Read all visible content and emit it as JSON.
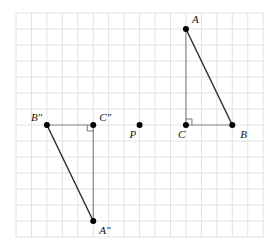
{
  "diagram": {
    "grid": {
      "columns": 16,
      "rows": 14
    },
    "points": {
      "A": {
        "label": "A",
        "gx": 11,
        "gy": 1
      },
      "B": {
        "label": "B",
        "gx": 14,
        "gy": 7
      },
      "C": {
        "label": "C",
        "gx": 11,
        "gy": 7
      },
      "P": {
        "label": "P",
        "gx": 8,
        "gy": 7
      },
      "A2": {
        "label": "A″",
        "gx": 5,
        "gy": 13
      },
      "B2": {
        "label": "B″",
        "gx": 2,
        "gy": 7
      },
      "C2": {
        "label": "C″",
        "gx": 5,
        "gy": 7
      }
    },
    "triangles": [
      {
        "name": "triangle-abc",
        "vertices": [
          "A",
          "B",
          "C"
        ],
        "right_angle_at": "C",
        "hypotenuse": [
          "A",
          "B"
        ]
      },
      {
        "name": "triangle-a2b2c2",
        "vertices": [
          "A2",
          "B2",
          "C2"
        ],
        "right_angle_at": "C2",
        "hypotenuse": [
          "A2",
          "B2"
        ]
      }
    ],
    "colors": {
      "grid": "#e2e2e2",
      "legs": "#8a8a8a",
      "hypotenuse": "#2a2a2a",
      "points": "#000000"
    }
  }
}
